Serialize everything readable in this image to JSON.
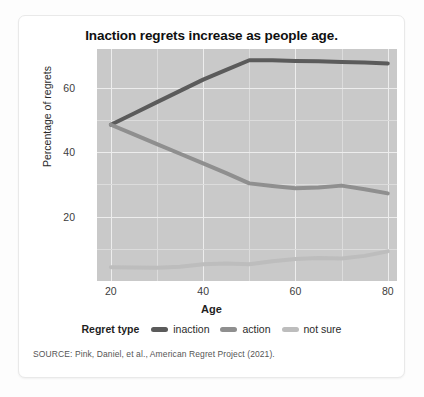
{
  "card": {
    "source_note": "SOURCE: Pink, Daniel, et al., American Regret Project (2021)."
  },
  "chart_data": {
    "type": "line",
    "title": "Inaction regrets increase as people age.",
    "xlabel": "Age",
    "ylabel": "Percentage of regrets",
    "xlim": [
      17,
      82
    ],
    "ylim": [
      0,
      72
    ],
    "grid": true,
    "legend_position": "bottom",
    "legend_title": "Regret type",
    "xticks": [
      20,
      40,
      60,
      80
    ],
    "yticks": [
      20,
      40,
      60
    ],
    "x": [
      20,
      25,
      30,
      35,
      40,
      45,
      50,
      55,
      60,
      65,
      70,
      75,
      80
    ],
    "series": [
      {
        "name": "inaction",
        "color": "#5b5b5b",
        "values": [
          48.5,
          52.0,
          55.5,
          59.0,
          62.5,
          65.5,
          68.5,
          68.5,
          68.3,
          68.2,
          68.0,
          67.8,
          67.5
        ]
      },
      {
        "name": "action",
        "color": "#8f8f8f",
        "values": [
          48.5,
          45.5,
          42.5,
          39.5,
          36.5,
          33.5,
          30.3,
          29.5,
          28.8,
          29.0,
          29.6,
          28.5,
          27.2
        ]
      },
      {
        "name": "not sure",
        "color": "#bdbdbd",
        "values": [
          4.3,
          4.2,
          4.1,
          4.4,
          5.2,
          5.4,
          5.2,
          6.1,
          6.8,
          7.1,
          7.0,
          7.8,
          9.2
        ]
      }
    ]
  }
}
